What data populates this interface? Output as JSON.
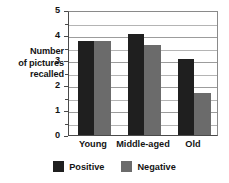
{
  "chart_data": {
    "type": "bar",
    "title": "",
    "xlabel": "",
    "ylabel": "Number of pictures recalled",
    "ylabel_lines": [
      "Number",
      "of pictures",
      "recalled"
    ],
    "categories": [
      "Young",
      "Middle-aged",
      "Old"
    ],
    "series": [
      {
        "name": "Positive",
        "color": "#1f1f1f",
        "values": [
          3.75,
          4.05,
          3.05
        ]
      },
      {
        "name": "Negative",
        "color": "#6b6b6b",
        "values": [
          3.78,
          3.6,
          1.7
        ]
      }
    ],
    "ylim": [
      0,
      5
    ],
    "yticks": [
      0,
      1,
      2,
      3,
      4,
      5
    ],
    "ytick_labels": [
      "0",
      "1",
      "2",
      "3",
      "4",
      "5"
    ],
    "minor_tick_step": 0.5,
    "grid": true,
    "grid_axis": "y",
    "legend_position": "bottom"
  },
  "legend": {
    "entries": [
      {
        "label": "Positive",
        "color": "#1f1f1f"
      },
      {
        "label": "Negative",
        "color": "#6b6b6b"
      }
    ]
  }
}
